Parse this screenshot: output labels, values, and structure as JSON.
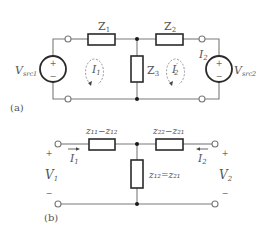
{
  "figure": {
    "panel_a": {
      "label": "(a)",
      "impedances": [
        {
          "id": "Z1",
          "main": "Z",
          "sub": "1"
        },
        {
          "id": "Z2",
          "main": "Z",
          "sub": "2"
        },
        {
          "id": "Z3",
          "main": "Z",
          "sub": "3"
        }
      ],
      "sources": [
        {
          "id": "vsrc1",
          "main": "V",
          "sub": "src1",
          "plus": "+",
          "minus": "−"
        },
        {
          "id": "vsrc2",
          "main": "V",
          "sub": "src2",
          "plus": "+",
          "minus": "−"
        }
      ],
      "currents": [
        {
          "id": "I1",
          "main": "I",
          "sub": "1"
        },
        {
          "id": "I2p",
          "main": "I",
          "sub": "2",
          "prime": "′"
        },
        {
          "id": "I2",
          "main": "I",
          "sub": "2"
        }
      ]
    },
    "panel_b": {
      "label": "(b)",
      "impedances": [
        {
          "id": "left",
          "text": "z₁₁−z₁₂"
        },
        {
          "id": "right",
          "text": "z₂₂−z₂₁"
        },
        {
          "id": "shunt",
          "text": "z₁₂=z₂₁"
        }
      ],
      "ports": [
        {
          "id": "port1",
          "voltage_main": "V",
          "voltage_sub": "1",
          "current_main": "I",
          "current_sub": "1",
          "plus": "+",
          "minus": "−"
        },
        {
          "id": "port2",
          "voltage_main": "V",
          "voltage_sub": "2",
          "current_main": "I",
          "current_sub": "2",
          "plus": "+",
          "minus": "−"
        }
      ]
    }
  }
}
